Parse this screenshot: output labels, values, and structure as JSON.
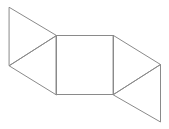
{
  "diagram": {
    "type": "net-of-polyhedron",
    "stroke_color": "#8a8a8a",
    "background": "#ffffff",
    "vertices": {
      "A": [
        9,
        7
      ],
      "B": [
        56,
        35
      ],
      "C": [
        9,
        65
      ],
      "D": [
        56,
        94
      ],
      "E": [
        113,
        35
      ],
      "F": [
        113,
        94
      ],
      "G": [
        160,
        64
      ],
      "H": [
        160,
        121
      ]
    },
    "shapes": [
      {
        "name": "left-upper-triangle",
        "points": [
          "A",
          "B",
          "C"
        ]
      },
      {
        "name": "left-lower-triangle",
        "points": [
          "C",
          "B",
          "D"
        ]
      },
      {
        "name": "center-square",
        "points": [
          "B",
          "E",
          "F",
          "D"
        ]
      },
      {
        "name": "right-upper-triangle",
        "points": [
          "E",
          "G",
          "F"
        ]
      },
      {
        "name": "right-lower-triangle",
        "points": [
          "F",
          "G",
          "H"
        ]
      }
    ]
  }
}
